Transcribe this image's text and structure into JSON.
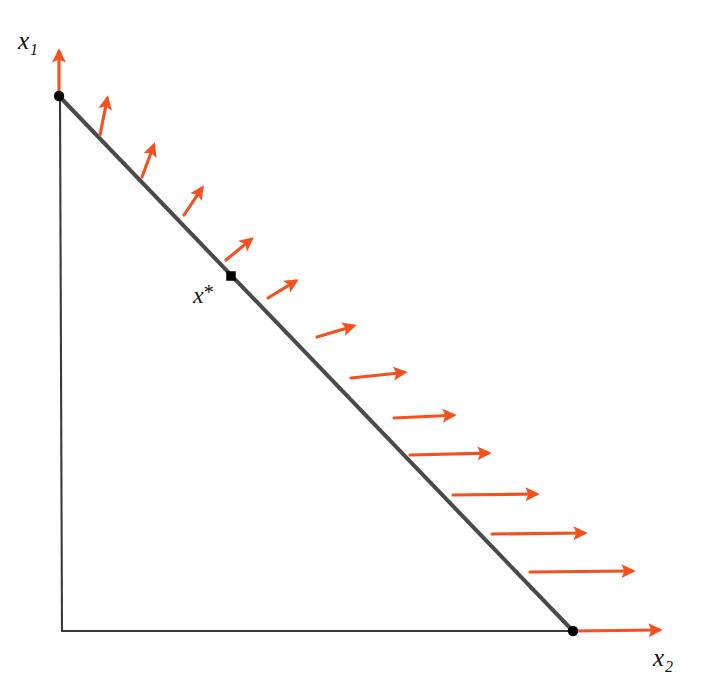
{
  "figure": {
    "kind": "geometry-diagram",
    "title_visible": false,
    "width": 718,
    "height": 699,
    "background_color": "#FFFFFF"
  },
  "labels": {
    "y_axis": {
      "base": "x",
      "subscript": "1",
      "text": "x1"
    },
    "x_axis": {
      "base": "x",
      "subscript": "2",
      "text": "x2"
    },
    "optimum": {
      "base": "x",
      "superscript": "*",
      "text": "x*"
    }
  },
  "colors": {
    "arrow": "#F4511E",
    "axis": "#3A3A3A",
    "constraint_line": "#4A4A4A",
    "point": "#000000"
  },
  "chart_data": {
    "type": "scatter",
    "title": "",
    "xlabel": "x2",
    "ylabel": "x1",
    "axes": {
      "origin": [
        62,
        631
      ],
      "y_axis_from": [
        60,
        97
      ],
      "y_axis_to": [
        62,
        631
      ],
      "x_axis_from": [
        62,
        631
      ],
      "x_axis_to": [
        573,
        631
      ],
      "grid": false,
      "ticks": []
    },
    "constraint_line": {
      "label": "feasible boundary",
      "from": [
        59,
        96
      ],
      "to": [
        573,
        631
      ],
      "color": "#4A4A4A",
      "width": 4
    },
    "points": [
      {
        "name": "vertex-top",
        "x": 59,
        "y": 96,
        "label": ""
      },
      {
        "name": "optimum",
        "x": 231,
        "y": 276,
        "label": "x*"
      },
      {
        "name": "vertex-bottom",
        "x": 573,
        "y": 631,
        "label": ""
      }
    ],
    "arrows": [
      {
        "index": 1,
        "base": [
          59,
          96
        ],
        "tip": [
          59,
          48
        ],
        "angle_deg": 90
      },
      {
        "index": 2,
        "base": [
          100,
          135
        ],
        "tip": [
          108,
          95
        ],
        "angle_deg": 79
      },
      {
        "index": 3,
        "base": [
          142,
          177
        ],
        "tip": [
          155,
          142
        ],
        "angle_deg": 70
      },
      {
        "index": 4,
        "base": [
          184,
          215
        ],
        "tip": [
          204,
          185
        ],
        "angle_deg": 56
      },
      {
        "index": 5,
        "base": [
          226,
          260
        ],
        "tip": [
          254,
          237
        ],
        "angle_deg": 39
      },
      {
        "index": 6,
        "base": [
          268,
          298
        ],
        "tip": [
          299,
          279
        ],
        "angle_deg": 31
      },
      {
        "index": 7,
        "base": [
          317,
          337
        ],
        "tip": [
          357,
          325
        ],
        "angle_deg": 17
      },
      {
        "index": 8,
        "base": [
          351,
          378
        ],
        "tip": [
          408,
          372
        ],
        "angle_deg": 6
      },
      {
        "index": 9,
        "base": [
          394,
          418
        ],
        "tip": [
          457,
          415
        ],
        "angle_deg": 3
      },
      {
        "index": 10,
        "base": [
          410,
          455
        ],
        "tip": [
          492,
          453
        ],
        "angle_deg": 1
      },
      {
        "index": 11,
        "base": [
          453,
          495
        ],
        "tip": [
          540,
          494
        ],
        "angle_deg": 1
      },
      {
        "index": 12,
        "base": [
          492,
          534
        ],
        "tip": [
          588,
          533
        ],
        "angle_deg": 0
      },
      {
        "index": 13,
        "base": [
          530,
          572
        ],
        "tip": [
          636,
          571
        ],
        "angle_deg": 0
      },
      {
        "index": 14,
        "base": [
          573,
          631
        ],
        "tip": [
          663,
          630
        ],
        "angle_deg": 0
      }
    ]
  }
}
